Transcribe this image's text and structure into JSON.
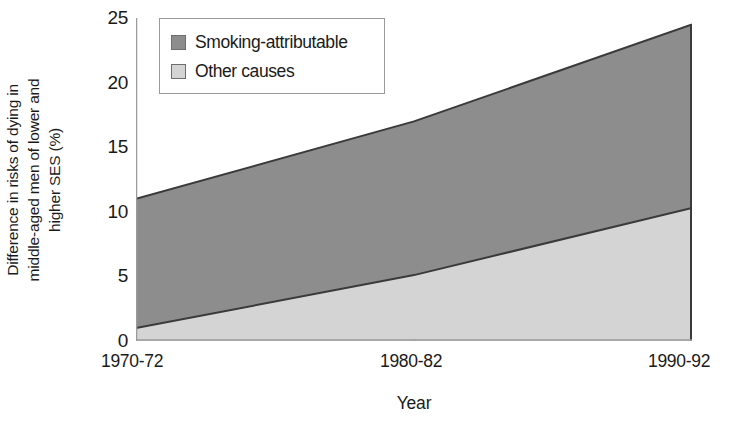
{
  "chart_data": {
    "type": "area",
    "title": "",
    "subtitle": "",
    "xlabel": "Year",
    "ylabel": "Difference in risks of dying in middle-aged men of lower and higher SES (%)",
    "ylabel_lines": [
      "Difference in risks of dying in",
      "middle-aged men of lower and",
      "higher SES (%)"
    ],
    "categories": [
      "1970-72",
      "1980-82",
      "1990-92"
    ],
    "x_tick_labels": [
      "1970-72",
      "1980-82",
      "1990-92"
    ],
    "y_tick_labels": [
      "0",
      "5",
      "10",
      "15",
      "20",
      "25"
    ],
    "y_ticks": [
      0,
      5,
      10,
      15,
      20,
      25
    ],
    "ylim": [
      0,
      25
    ],
    "stacked": true,
    "grid": false,
    "legend_position": "top-left-inside",
    "series": [
      {
        "name": "Other causes",
        "color": "#d4d4d4",
        "values": [
          1.0,
          5.1,
          10.3
        ]
      },
      {
        "name": "Smoking-attributable",
        "color": "#8d8d8d",
        "values": [
          10.0,
          11.9,
          14.2
        ]
      }
    ],
    "cumulative_totals": [
      11.0,
      17.0,
      24.5
    ],
    "annotations": []
  },
  "legend": {
    "items": [
      {
        "label": "Smoking-attributable",
        "swatch_color": "#8d8d8d"
      },
      {
        "label": "Other causes",
        "swatch_color": "#d4d4d4"
      }
    ]
  },
  "colors": {
    "smoking_attributable": "#8d8d8d",
    "other_causes": "#d4d4d4",
    "axis": "#8a8a8a",
    "outline": "#3a3a3a",
    "text": "#1a1a1a",
    "legend_border": "#9a9a9a",
    "background": "#ffffff"
  }
}
